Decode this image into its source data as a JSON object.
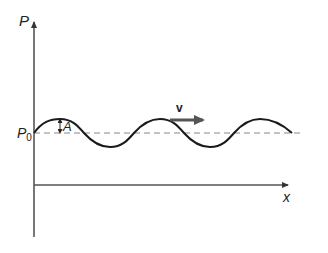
{
  "diagram": {
    "type": "wave-pressure-plot",
    "y_axis_label": "P",
    "x_axis_label": "x",
    "equilibrium_label": "P",
    "equilibrium_subscript": "0",
    "amplitude_label": "A",
    "velocity_label": "v",
    "colors": {
      "axes": "#555555",
      "wave": "#1a1a1a",
      "dashed": "#888888",
      "arrow": "#555555",
      "text": "#222222"
    }
  }
}
